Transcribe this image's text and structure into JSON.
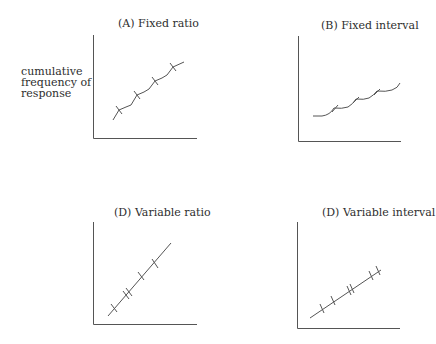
{
  "ylabel": [
    "cumulative",
    "frequency of",
    "response"
  ],
  "panels": [
    {
      "id": "A",
      "title": "(A)  Fixed ratio"
    },
    {
      "id": "B",
      "title": "(B)  Fixed interval"
    },
    {
      "id": "C",
      "title": "(D)  Variable ratio"
    },
    {
      "id": "D",
      "title": "(D)  Variable interval"
    }
  ],
  "colors": {
    "line": "#555555",
    "axis": "#555555",
    "text": "#2e2e2e"
  }
}
